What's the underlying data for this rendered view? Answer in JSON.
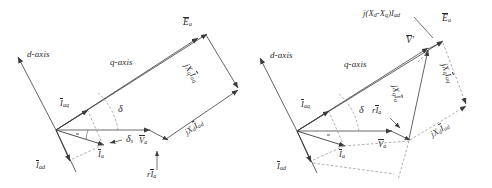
{
  "figure": {
    "background_color": "#ffffff",
    "stroke_color": "#3c3c3c",
    "text_color": "#2b2b2b",
    "panel_count": 2
  },
  "left_diagram": {
    "name": "classic-two-reaction-phasor-diagram",
    "labels": {
      "d_axis": "d-axis",
      "q_axis": "q-axis",
      "Ea": "E",
      "Ea_sub": "a",
      "jXq_Iaq": "jX",
      "jXq_Iaq_sub1": "q",
      "jXq_Iaq_I": "I",
      "jXq_Iaq_sub2": "aq",
      "jXd_Iad": "jX",
      "jXd_Iad_sub1": "d",
      "jXd_Iad_I": "I",
      "jXd_Iad_sub2": "ad",
      "Iaq": "I",
      "Iaq_sub": "aq",
      "Iad": "I",
      "Iad_sub": "ad",
      "Ia": "I",
      "Ia_sub": "a",
      "Va": "V",
      "Va_sub": "a",
      "r_Ia": "r",
      "r_Ia_I": "I",
      "r_Ia_sub": "a",
      "delta": "δ",
      "delta_s": "δ",
      "delta_s_sub": "s"
    }
  },
  "right_diagram": {
    "name": "equivalent-emf-phasor-diagram",
    "labels": {
      "d_axis": "d-axis",
      "q_axis": "q-axis",
      "Ea": "E",
      "Ea_sub": "a",
      "V_prime": "V",
      "V_prime_mark": "′",
      "jXd_minus_Xq_Iad": "j(X",
      "jXd_minus_Xq_sub1": "d",
      "jXd_minus_Xq_dash": "-X",
      "jXd_minus_Xq_sub2": "q",
      "jXd_minus_Xq_close": ")I",
      "jXd_minus_Xq_sub3": "ad",
      "jXq_Iaq": "jX",
      "jXq_Iaq_sub1": "q",
      "jXq_Iaq_I": "I",
      "jXq_Iaq_sub2": "aq",
      "jXq_Ia": "jX",
      "jXq_Ia_sub1": "q",
      "jXq_Ia_I": "I",
      "jXq_Ia_sub2": "a",
      "jXd_Iad": "jX",
      "jXd_Iad_sub1": "d",
      "jXd_Iad_I": "I",
      "jXd_Iad_sub2": "ad",
      "Iaq": "I",
      "Iaq_sub": "aq",
      "Iad": "I",
      "Iad_sub": "ad",
      "Ia": "I",
      "Ia_sub": "a",
      "Va": "V",
      "Va_sub": "a",
      "r_Ia": "r",
      "r_Ia_I": "I",
      "r_Ia_sub": "a",
      "delta": "δ"
    }
  }
}
